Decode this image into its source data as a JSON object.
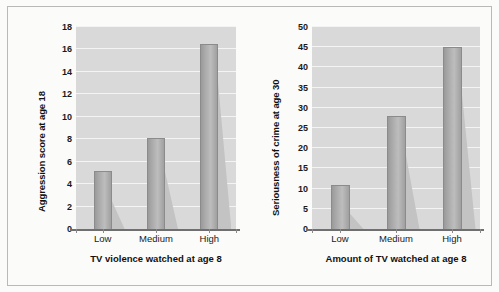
{
  "figure": {
    "background_color": "#fbfbfa",
    "frame_color": "#b9b9b9",
    "plot_background_color": "#d9d9d9",
    "gridline_color": "#f4f4f4",
    "bar_color": "#a8a8a8",
    "bar_shadow_color": "#c3c3c3",
    "axis_color": "#6f6f6f"
  },
  "chart_data": [
    {
      "type": "bar",
      "title": "",
      "xlabel": "TV violence watched at age 8",
      "ylabel": "Aggression score at age 18",
      "categories": [
        "Low",
        "Medium",
        "High"
      ],
      "values": [
        5.2,
        8.1,
        16.5
      ],
      "ylim": [
        0,
        18
      ],
      "ytick_step": 2,
      "yticks": [
        0,
        2,
        4,
        6,
        8,
        10,
        12,
        14,
        16,
        18
      ],
      "ytick_labels": [
        "0",
        "2",
        "4",
        "6",
        "8",
        "10",
        "12",
        "14",
        "16",
        "18"
      ],
      "grid": true,
      "legend": "none"
    },
    {
      "type": "bar",
      "title": "",
      "xlabel": "Amount of TV watched at age 8",
      "ylabel": "Seriousness of crime at age 30",
      "categories": [
        "Low",
        "Medium",
        "High"
      ],
      "values": [
        11,
        28,
        45
      ],
      "ylim": [
        0,
        50
      ],
      "ytick_step": 5,
      "yticks": [
        0,
        5,
        10,
        15,
        20,
        25,
        30,
        35,
        40,
        45,
        50
      ],
      "ytick_labels": [
        "0",
        "5",
        "10",
        "15",
        "20",
        "25",
        "30",
        "35",
        "40",
        "45",
        "50"
      ],
      "grid": true,
      "legend": "none"
    }
  ]
}
